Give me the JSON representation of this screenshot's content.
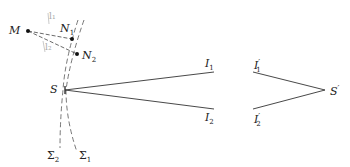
{
  "diagram": {
    "colors": {
      "line": "#333333",
      "dashed": "#555555",
      "faint": "#aaaaaa",
      "background": "#ffffff"
    },
    "points": {
      "M": {
        "label": "M",
        "x": 28,
        "y": 31
      },
      "N1": {
        "label": "N",
        "sub": "1",
        "x": 72,
        "y": 39
      },
      "N2": {
        "label": "N",
        "sub": "2",
        "x": 77,
        "y": 54
      },
      "S": {
        "label": "S",
        "x": 65,
        "y": 90
      },
      "I1": {
        "label": "I",
        "sub": "1",
        "x": 214,
        "y": 72
      },
      "I2": {
        "label": "I",
        "sub": "2",
        "x": 214,
        "y": 109
      },
      "I1p": {
        "label": "I",
        "sub": "1",
        "prime": "′",
        "x": 253,
        "y": 72
      },
      "I2p": {
        "label": "I",
        "sub": "2",
        "prime": "′",
        "x": 253,
        "y": 109
      },
      "Sp": {
        "label": "S",
        "prime": "′",
        "x": 325,
        "y": 90
      }
    },
    "wavefronts": {
      "sigma1": {
        "label": "Σ",
        "sub": "1"
      },
      "sigma2": {
        "label": "Σ",
        "sub": "2"
      }
    },
    "faint_labels": {
      "l1": "l₁",
      "l2": "l₂"
    }
  }
}
